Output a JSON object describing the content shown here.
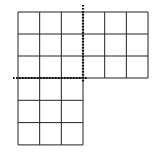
{
  "diagram": {
    "colors": {
      "background": "#ffffff",
      "grid_line": "#222222",
      "dotted_line": "#111111"
    },
    "top_grid": {
      "cols": 6,
      "rows": 3,
      "x": 18,
      "y": 12,
      "cell_w": 21.67,
      "cell_h": 22
    },
    "bottom_grid": {
      "cols": 3,
      "rows": 3,
      "x": 18,
      "y": 78,
      "cell_w": 21.67,
      "cell_h": 22.3
    },
    "dotted_lines": [
      {
        "name": "vertical-cut",
        "x1": 83,
        "y1": 5,
        "x2": 83,
        "y2": 82
      },
      {
        "name": "horizontal-cut",
        "x1": 13,
        "y1": 78,
        "x2": 87,
        "y2": 78
      }
    ]
  }
}
